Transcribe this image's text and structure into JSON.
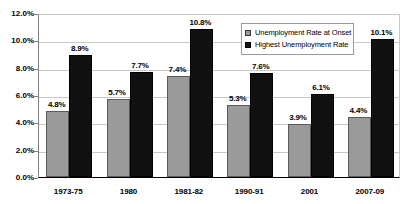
{
  "chart_data": {
    "type": "bar",
    "title": "",
    "xlabel": "",
    "ylabel": "",
    "ylim": [
      0,
      12
    ],
    "ytick_labels": [
      "12.0%",
      "10.0%",
      "8.0%",
      "6.0%",
      "4.0%",
      "2.0%",
      "0.0%"
    ],
    "ytick_values": [
      12,
      10,
      8,
      6,
      4,
      2,
      0
    ],
    "grid": true,
    "legend_position": "upper-right-inside",
    "categories": [
      "1973-75",
      "1980",
      "1981-82",
      "1990-91",
      "2001",
      "2007-09"
    ],
    "series": [
      {
        "name": "Unemployment Rate at Onset",
        "color": "#9a9a9a",
        "values": [
          4.8,
          5.7,
          7.4,
          5.3,
          3.9,
          4.4
        ],
        "labels": [
          "4.8%",
          "5.7%",
          "7.4%",
          "5.3%",
          "3.9%",
          "4.4%"
        ]
      },
      {
        "name": "Highest Unemployment Rate",
        "color": "#111111",
        "values": [
          8.9,
          7.7,
          10.8,
          7.6,
          6.1,
          10.1
        ],
        "labels": [
          "8.9%",
          "7.7%",
          "10.8%",
          "7.6%",
          "6.1%",
          "10.1%"
        ]
      }
    ]
  },
  "legend": {
    "items": [
      {
        "label": "Unemployment Rate at Onset",
        "swatch": "onset"
      },
      {
        "label": "Highest Unemployment Rate",
        "swatch": "highest"
      }
    ]
  },
  "colors": {
    "onset": "#9a9a9a",
    "highest": "#111111",
    "gridline": "#c8c8c8",
    "axis": "#000000",
    "background": "#ffffff"
  }
}
